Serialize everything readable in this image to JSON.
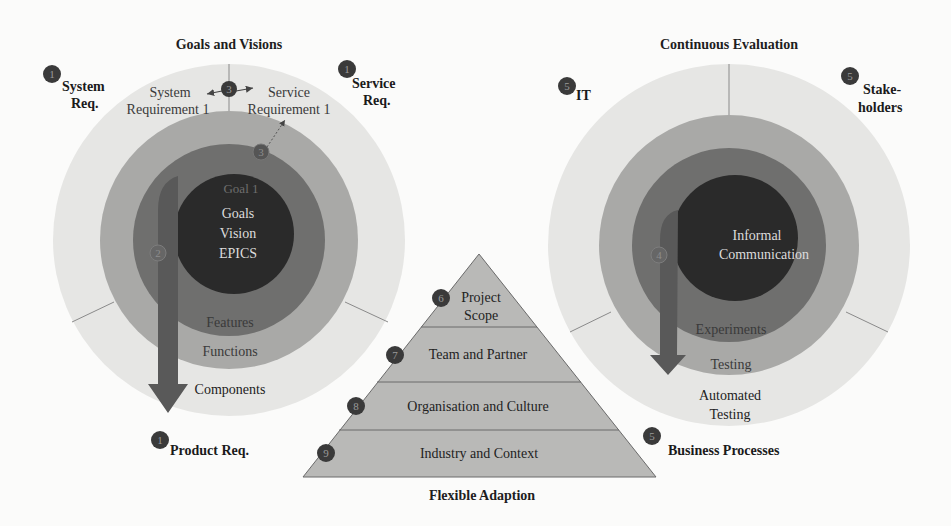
{
  "colors": {
    "background": "#fbfbfa",
    "outer_ring": "#e6e6e4",
    "middle_ring": "#a9a9a7",
    "dark_ring": "#6f6f6e",
    "core": "#2a2a2a",
    "arrow": "#595959",
    "badge": "#3a3a3a",
    "pyramid_fill": "#b9b9b7",
    "pyramid_line": "#6a6a6a"
  },
  "goals_and_visions": {
    "title": "Goals and Visions",
    "core": {
      "faint_label": "Goal 1",
      "lines": [
        "Goals",
        "Vision",
        "EPICS"
      ]
    },
    "rings": {
      "dark": "Features",
      "middle": "Functions",
      "outer": "Components"
    },
    "top_labels": {
      "left": [
        "System",
        "Requirement 1"
      ],
      "right": [
        "Service",
        "Requirement 1"
      ]
    },
    "badges": {
      "top_center": "3",
      "inner_right": "3",
      "arrow": "2"
    },
    "outside_labels": [
      {
        "badge": "1",
        "lines": [
          "System",
          "Req."
        ]
      },
      {
        "badge": "1",
        "lines": [
          "Service",
          "Req."
        ]
      },
      {
        "badge": "1",
        "lines": [
          "Product Req."
        ]
      }
    ]
  },
  "continuous_evaluation": {
    "title": "Continuous Evaluation",
    "core": {
      "lines": [
        "Informal",
        "Communication"
      ]
    },
    "rings": {
      "dark": "Experiments",
      "middle": "Testing",
      "outer": [
        "Automated",
        "Testing"
      ]
    },
    "badges": {
      "arrow": "4"
    },
    "outside_labels": [
      {
        "badge": "5",
        "lines": [
          "IT"
        ]
      },
      {
        "badge": "5",
        "lines": [
          "Stake-",
          "holders"
        ]
      },
      {
        "badge": "5",
        "lines": [
          "Business Processes"
        ]
      }
    ]
  },
  "flexible_adaption": {
    "title": "Flexible Adaption",
    "levels": [
      {
        "badge": "6",
        "lines": [
          "Project",
          "Scope"
        ]
      },
      {
        "badge": "7",
        "lines": [
          "Team and Partner"
        ]
      },
      {
        "badge": "8",
        "lines": [
          "Organisation and Culture"
        ]
      },
      {
        "badge": "9",
        "lines": [
          "Industry and Context"
        ]
      }
    ]
  }
}
